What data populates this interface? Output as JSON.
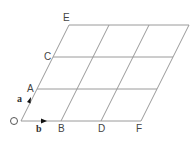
{
  "diagram": {
    "type": "parallelogram-grid",
    "origin": {
      "x": 21,
      "y": 121
    },
    "vector_a": {
      "dx": 16,
      "dy": -32
    },
    "vector_b": {
      "dx": 40,
      "dy": 0
    },
    "rows": 3,
    "cols": 3,
    "colors": {
      "grid": "#9a9a9a",
      "text": "#444444",
      "arrow": "#111111"
    }
  },
  "labels": {
    "O": "O",
    "A": "A",
    "C": "C",
    "E": "E",
    "B": "B",
    "D": "D",
    "F": "F",
    "a": "a",
    "b": "b"
  }
}
